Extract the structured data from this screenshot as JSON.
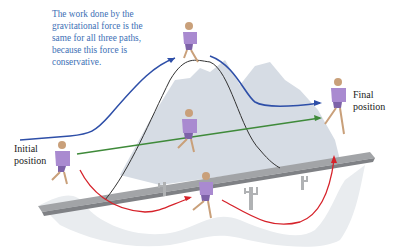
{
  "caption": {
    "line1": "The work done by the",
    "line2": "gravitational force is the",
    "line3": "same for all three paths,",
    "line4": "because this force is",
    "line5": "conservative."
  },
  "labels": {
    "initial_line1": "Initial",
    "initial_line2": "position",
    "final_line1": "Final",
    "final_line2": "position"
  },
  "colors": {
    "caption_text": "#3d6fb5",
    "path_blue": "#2e4fa8",
    "path_green": "#3f8a3a",
    "path_red": "#d6222a",
    "path_black": "#333333",
    "mountain": "#d5dbe3",
    "ramp": "#9a9c9e",
    "runner": "#a98ad0"
  },
  "paths": [
    {
      "name": "over-the-hill",
      "color": "blue"
    },
    {
      "name": "straight-ramp",
      "color": "green"
    },
    {
      "name": "through-valley",
      "color": "red"
    }
  ]
}
